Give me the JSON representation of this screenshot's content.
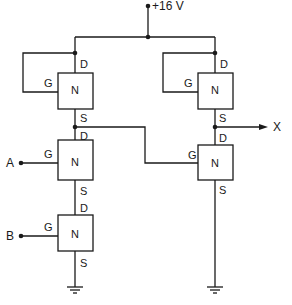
{
  "diagram": {
    "supply_label": "+16 V",
    "output_label": "X",
    "inputs": [
      {
        "label": "A"
      },
      {
        "label": "B"
      }
    ],
    "transistors": [
      {
        "id": "load-left",
        "type": "N",
        "gate": "G",
        "drain": "D",
        "source": "S"
      },
      {
        "id": "input-a",
        "type": "N",
        "gate": "G",
        "drain": "D",
        "source": "S"
      },
      {
        "id": "input-b",
        "type": "N",
        "gate": "G",
        "drain": "D",
        "source": "S"
      },
      {
        "id": "load-right",
        "type": "N",
        "gate": "G",
        "drain": "D",
        "source": "S"
      },
      {
        "id": "inverter",
        "type": "N",
        "gate": "G",
        "drain": "D",
        "source": "S"
      }
    ],
    "colors": {
      "line": "#1a1a1a",
      "background": "#ffffff"
    }
  }
}
